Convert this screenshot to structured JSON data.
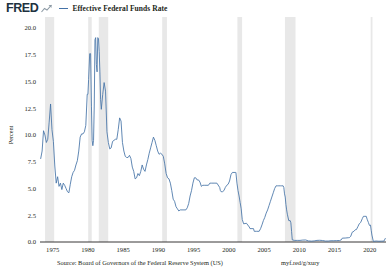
{
  "header": {
    "logo_text": "FRED",
    "logo_mark_name": "fred-graph-mark",
    "legend": [
      {
        "label": "Effective Federal Funds Rate",
        "color": "#4572a7"
      }
    ]
  },
  "footer": {
    "source": "Source: Board of Governors of the Federal Reserve System (US)",
    "permalink": "myf.red/g/xury"
  },
  "chart_data": {
    "type": "line",
    "title": "Effective Federal Funds Rate",
    "xlabel": "",
    "ylabel": "Percent",
    "xlim": [
      1973.2,
      2022.3
    ],
    "ylim": [
      0.0,
      20.0
    ],
    "xticks": [
      1975,
      1980,
      1985,
      1990,
      1995,
      2000,
      2005,
      2010,
      2015,
      2020
    ],
    "xtick_labels": [
      "1975",
      "1980",
      "1985",
      "1990",
      "1995",
      "2000",
      "2005",
      "2010",
      "2015",
      "2020"
    ],
    "yticks": [
      0.0,
      2.5,
      5.0,
      7.5,
      10.0,
      12.5,
      15.0,
      17.5,
      20.0
    ],
    "ytick_labels": [
      "0.0",
      "2.5",
      "5.0",
      "7.5",
      "10.0",
      "12.5",
      "15.0",
      "17.5",
      "20.0"
    ],
    "grid": false,
    "legend_position": "top",
    "line_color": "#4572a7",
    "recession_band_color": "#e8e8e8",
    "recession_bands": [
      [
        1973.92,
        1975.21
      ],
      [
        1980.04,
        1980.54
      ],
      [
        1981.54,
        1982.88
      ],
      [
        1990.54,
        1991.21
      ],
      [
        2001.21,
        2001.88
      ],
      [
        2007.96,
        2009.46
      ],
      [
        2020.13,
        2020.38
      ]
    ],
    "series": [
      {
        "name": "Effective Federal Funds Rate",
        "x": [
          1973.3,
          1973.5,
          1973.7,
          1973.9,
          1974.1,
          1974.3,
          1974.5,
          1974.7,
          1974.9,
          1975.1,
          1975.3,
          1975.5,
          1975.7,
          1975.9,
          1976.1,
          1976.3,
          1976.5,
          1976.7,
          1976.9,
          1977.1,
          1977.3,
          1977.5,
          1977.7,
          1977.9,
          1978.1,
          1978.3,
          1978.5,
          1978.7,
          1978.9,
          1979.1,
          1979.3,
          1979.5,
          1979.7,
          1979.9,
          1980.0,
          1980.1,
          1980.25,
          1980.38,
          1980.5,
          1980.6,
          1980.7,
          1980.8,
          1980.9,
          1981.0,
          1981.1,
          1981.2,
          1981.3,
          1981.4,
          1981.5,
          1981.6,
          1981.7,
          1981.8,
          1981.9,
          1982.1,
          1982.3,
          1982.5,
          1982.7,
          1982.9,
          1983.1,
          1983.3,
          1983.5,
          1983.7,
          1983.9,
          1984.1,
          1984.3,
          1984.5,
          1984.7,
          1984.9,
          1985.1,
          1985.3,
          1985.5,
          1985.7,
          1985.9,
          1986.1,
          1986.3,
          1986.5,
          1986.7,
          1986.9,
          1987.1,
          1987.3,
          1987.5,
          1987.7,
          1987.9,
          1988.1,
          1988.3,
          1988.5,
          1988.7,
          1988.9,
          1989.1,
          1989.3,
          1989.5,
          1989.7,
          1989.9,
          1990.1,
          1990.3,
          1990.5,
          1990.7,
          1990.9,
          1991.1,
          1991.3,
          1991.5,
          1991.7,
          1991.9,
          1992.1,
          1992.3,
          1992.5,
          1992.7,
          1992.9,
          1993.1,
          1993.5,
          1993.9,
          1994.1,
          1994.3,
          1994.5,
          1994.7,
          1994.9,
          1995.1,
          1995.3,
          1995.5,
          1995.7,
          1995.9,
          1996.1,
          1996.3,
          1996.5,
          1996.9,
          1997.1,
          1997.3,
          1997.5,
          1997.9,
          1998.3,
          1998.7,
          1998.8,
          1998.9,
          1999.1,
          1999.3,
          1999.5,
          1999.7,
          1999.9,
          2000.1,
          2000.3,
          2000.5,
          2000.9,
          2001.0,
          2001.15,
          2001.3,
          2001.45,
          2001.6,
          2001.75,
          2001.9,
          2002.1,
          2002.5,
          2002.9,
          2003.0,
          2003.5,
          2003.6,
          2003.9,
          2004.3,
          2004.5,
          2004.7,
          2004.9,
          2005.1,
          2005.3,
          2005.5,
          2005.7,
          2005.9,
          2006.1,
          2006.3,
          2006.5,
          2006.7,
          2006.9,
          2007.1,
          2007.3,
          2007.5,
          2007.7,
          2007.8,
          2007.9,
          2008.0,
          2008.1,
          2008.2,
          2008.3,
          2008.5,
          2008.7,
          2008.8,
          2008.9,
          2009.0,
          2009.3,
          2009.7,
          2010.1,
          2010.5,
          2010.9,
          2011.3,
          2011.7,
          2012.1,
          2012.5,
          2012.9,
          2013.3,
          2013.7,
          2014.1,
          2014.5,
          2014.9,
          2015.3,
          2015.7,
          2015.95,
          2016.1,
          2016.5,
          2016.95,
          2017.1,
          2017.3,
          2017.5,
          2017.75,
          2017.95,
          2018.1,
          2018.3,
          2018.5,
          2018.7,
          2018.95,
          2019.1,
          2019.3,
          2019.5,
          2019.62,
          2019.8,
          2019.95,
          2020.1,
          2020.2,
          2020.3,
          2020.5,
          2020.9,
          2021.3,
          2021.7,
          2022.0,
          2022.2
        ],
        "values": [
          7.8,
          8.5,
          10.4,
          10.0,
          9.3,
          9.6,
          11.2,
          12.9,
          10.5,
          9.4,
          7.1,
          5.5,
          6.1,
          5.2,
          5.5,
          4.9,
          5.5,
          5.3,
          5.0,
          4.7,
          4.6,
          5.4,
          6.1,
          6.5,
          6.7,
          7.2,
          7.6,
          8.5,
          9.8,
          10.1,
          10.1,
          10.3,
          10.9,
          13.8,
          13.8,
          15.2,
          17.6,
          17.6,
          12.7,
          9.5,
          9.0,
          9.5,
          12.8,
          18.9,
          19.1,
          16.6,
          15.9,
          19.1,
          19.0,
          17.8,
          15.9,
          13.3,
          12.4,
          13.8,
          14.9,
          14.1,
          10.3,
          9.3,
          8.7,
          8.8,
          9.4,
          9.5,
          9.6,
          9.6,
          10.5,
          11.6,
          11.3,
          9.3,
          8.5,
          8.0,
          7.9,
          7.9,
          8.1,
          7.8,
          7.0,
          6.6,
          5.9,
          6.0,
          6.4,
          6.2,
          6.6,
          7.2,
          6.8,
          6.6,
          7.2,
          7.7,
          8.3,
          8.8,
          9.3,
          9.8,
          9.5,
          9.0,
          8.5,
          8.2,
          8.3,
          8.2,
          8.0,
          7.3,
          6.4,
          6.0,
          5.9,
          5.5,
          4.8,
          4.0,
          3.8,
          3.3,
          3.1,
          2.9,
          3.0,
          3.0,
          3.0,
          3.2,
          3.6,
          4.3,
          4.8,
          5.5,
          6.0,
          6.0,
          5.8,
          5.8,
          5.6,
          5.2,
          5.3,
          5.3,
          5.3,
          5.3,
          5.5,
          5.5,
          5.5,
          5.5,
          5.1,
          4.8,
          4.7,
          4.7,
          4.8,
          5.1,
          5.3,
          5.4,
          5.7,
          6.3,
          6.5,
          6.5,
          6.5,
          5.5,
          4.8,
          4.3,
          3.7,
          3.1,
          2.1,
          1.7,
          1.75,
          1.4,
          1.25,
          1.25,
          1.0,
          1.0,
          1.0,
          1.25,
          1.6,
          2.0,
          2.3,
          2.7,
          3.0,
          3.4,
          3.8,
          4.2,
          4.6,
          5.0,
          5.25,
          5.25,
          5.25,
          5.25,
          5.25,
          5.25,
          5.1,
          4.5,
          4.2,
          3.5,
          3.0,
          2.6,
          2.0,
          2.0,
          1.8,
          1.0,
          0.2,
          0.15,
          0.15,
          0.15,
          0.18,
          0.19,
          0.1,
          0.08,
          0.1,
          0.15,
          0.16,
          0.14,
          0.09,
          0.09,
          0.12,
          0.12,
          0.13,
          0.14,
          0.2,
          0.36,
          0.37,
          0.4,
          0.41,
          0.54,
          0.91,
          1.0,
          1.15,
          1.16,
          1.42,
          1.7,
          1.82,
          2.2,
          2.4,
          2.4,
          2.4,
          2.13,
          1.83,
          1.55,
          1.58,
          1.1,
          0.65,
          0.06,
          0.09,
          0.07,
          0.08,
          0.08,
          0.33
        ]
      }
    ]
  }
}
